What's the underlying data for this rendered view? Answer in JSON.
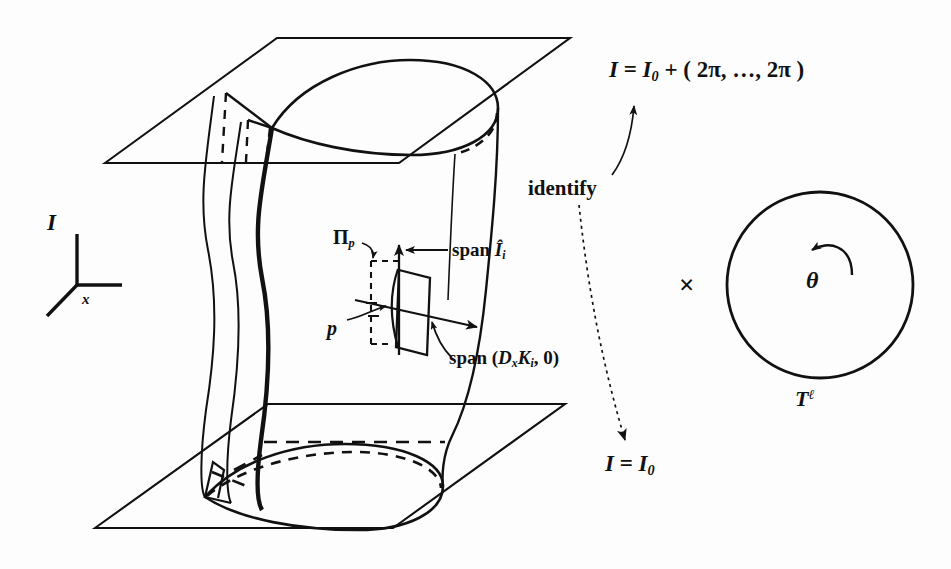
{
  "figure": {
    "background_color": "#fdfdfd",
    "ink_color": "#111111"
  },
  "labels": {
    "top_identification": {
      "text": "I = I0 + ( 2π, …, 2π )",
      "parts": {
        "lhs": "I",
        "eq": "=",
        "base": "I",
        "sub": "0",
        "plus": "+",
        "tuple": "( 2π, …, 2π )"
      }
    },
    "bottom_identification": {
      "text": "I = I0",
      "parts": {
        "lhs": "I",
        "eq": "=",
        "base": "I",
        "sub": "0"
      }
    },
    "identify": "identify",
    "axis_I": "I",
    "axis_x": "x",
    "plane_pi_p": {
      "text": "Πp",
      "base": "Π",
      "sub": "p"
    },
    "point_p": "p",
    "span_I_hat": {
      "text": "span Î i",
      "word": "span",
      "base": "Î",
      "sub": "i"
    },
    "span_DxK": {
      "text": "span ( Dx Ki , 0 )",
      "word": "span",
      "open": "(",
      "D": "D",
      "Dsub": "x",
      "K": "K",
      "Ksub": "i",
      "comma_zero": ", 0",
      "close": ")"
    },
    "cross_product": "×",
    "theta": "θ",
    "torus": {
      "text": "Tℓ",
      "base": "T",
      "sup": "ℓ"
    }
  },
  "elements": {
    "top_plane": "upper-constant-action-plane",
    "bottom_plane": "lower-constant-action-plane",
    "cylinder_surface": "whiskered-invariant-cylinder",
    "top_loop": "upper-teardrop-loop",
    "bottom_loop": "lower-teardrop-loop",
    "tangent_parallelogram": "tangent-plane-at-p",
    "circle": "torus-factor-circle",
    "rotation_arrow": "theta-rotation-arrow",
    "axis_frame": "coordinate-axis-triad"
  }
}
